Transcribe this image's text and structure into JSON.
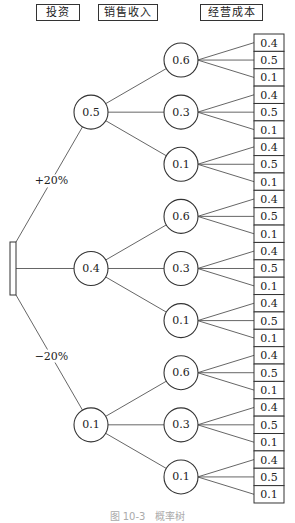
{
  "headers": {
    "investment": "投资",
    "sales_revenue": "销售收入",
    "operating_cost": "经营成本"
  },
  "root": {
    "type": "decision-node"
  },
  "branches": [
    {
      "label": "+20%",
      "probability": "0.5",
      "sales": [
        {
          "probability": "0.6",
          "costs": [
            "0.4",
            "0.5",
            "0.1"
          ]
        },
        {
          "probability": "0.3",
          "costs": [
            "0.4",
            "0.5",
            "0.1"
          ]
        },
        {
          "probability": "0.1",
          "costs": [
            "0.4",
            "0.5",
            "0.1"
          ]
        }
      ]
    },
    {
      "label": "",
      "probability": "0.4",
      "sales": [
        {
          "probability": "0.6",
          "costs": [
            "0.4",
            "0.5",
            "0.1"
          ]
        },
        {
          "probability": "0.3",
          "costs": [
            "0.4",
            "0.5",
            "0.1"
          ]
        },
        {
          "probability": "0.1",
          "costs": [
            "0.4",
            "0.5",
            "0.1"
          ]
        }
      ]
    },
    {
      "label": "−20%",
      "probability": "0.1",
      "sales": [
        {
          "probability": "0.6",
          "costs": [
            "0.4",
            "0.5",
            "0.1"
          ]
        },
        {
          "probability": "0.3",
          "costs": [
            "0.4",
            "0.5",
            "0.1"
          ]
        },
        {
          "probability": "0.1",
          "costs": [
            "0.4",
            "0.5",
            "0.1"
          ]
        }
      ]
    }
  ],
  "caption": "图 10-3　概率树"
}
